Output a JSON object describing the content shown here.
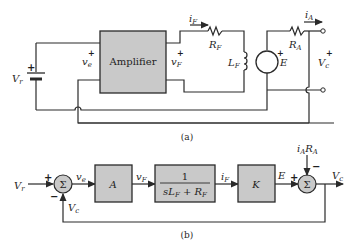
{
  "figure_a": {
    "caption": "(a)",
    "amplifier_label": "Amplifier",
    "labels": {
      "Vr": "V",
      "Vr_sub": "r",
      "ve": "v",
      "ve_sub": "e",
      "vF": "v",
      "vF_sub": "F",
      "iF": "i",
      "iF_sub": "F",
      "RF": "R",
      "RF_sub": "F",
      "LF": "L",
      "LF_sub": "F",
      "E": "E",
      "RA": "R",
      "RA_sub": "A",
      "iA": "i",
      "iA_sub": "A",
      "Vc": "V",
      "Vc_sub": "c"
    },
    "plus": "+"
  },
  "figure_b": {
    "caption": "(b)",
    "sigma": "Σ",
    "blocks": {
      "A": "A",
      "tf_num": "1",
      "tf_den": "sL",
      "tf_den_sub": "F",
      "tf_den_rest": " + R",
      "tf_den_rest_sub": "F",
      "K": "K"
    },
    "signals": {
      "Vr": "V",
      "Vr_sub": "r",
      "ve": "v",
      "ve_sub": "e",
      "vF": "v",
      "vF_sub": "F",
      "iF": "i",
      "iF_sub": "F",
      "E": "E",
      "Vc": "V",
      "Vc_sub": "c",
      "Vc_fb": "V",
      "Vc_fb_sub": "c",
      "iARA": "i",
      "iARA_sub1": "A",
      "iARA_R": "R",
      "iARA_sub2": "A"
    },
    "signs": {
      "plus": "+",
      "minus": "−"
    }
  }
}
